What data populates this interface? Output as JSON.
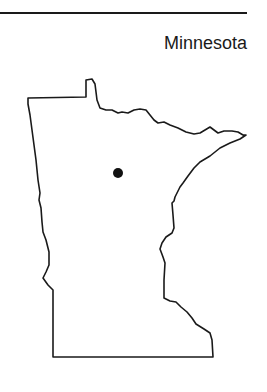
{
  "map": {
    "title": "Minnesota",
    "marker": {
      "label": "location-marker",
      "cx": 118,
      "cy": 173,
      "r": 5
    },
    "colors": {
      "outline": "#1a1a1a",
      "marker": "#111111",
      "background": "#ffffff"
    }
  }
}
